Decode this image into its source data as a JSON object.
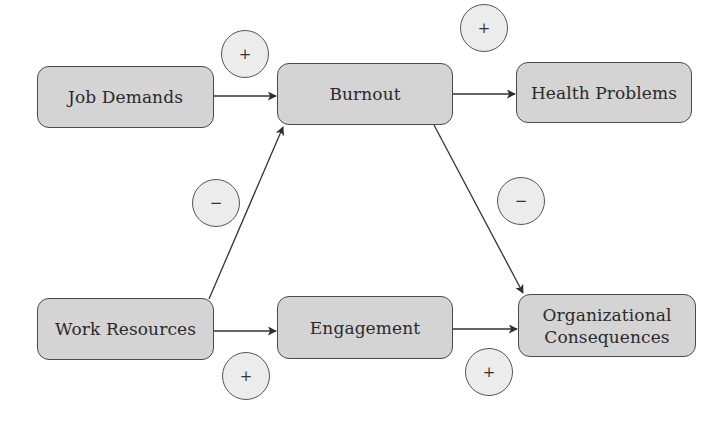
{
  "diagram": {
    "type": "flow",
    "nodes": [
      {
        "id": "job_demands",
        "label": "Job Demands"
      },
      {
        "id": "burnout",
        "label": "Burnout"
      },
      {
        "id": "health_problems",
        "label": "Health Problems"
      },
      {
        "id": "work_resources",
        "label": "Work Resources"
      },
      {
        "id": "engagement",
        "label": "Engagement"
      },
      {
        "id": "org_consequences",
        "label_line1": "Organizational",
        "label_line2": "Consequences"
      }
    ],
    "edges": [
      {
        "from": "Job Demands",
        "to": "Burnout",
        "sign": "+"
      },
      {
        "from": "Burnout",
        "to": "Health Problems",
        "sign": "+"
      },
      {
        "from": "Work Resources",
        "to": "Burnout",
        "sign": "−"
      },
      {
        "from": "Burnout",
        "to": "Organizational Consequences",
        "sign": "−"
      },
      {
        "from": "Work Resources",
        "to": "Engagement",
        "sign": "+"
      },
      {
        "from": "Engagement",
        "to": "Organizational Consequences",
        "sign": "+"
      }
    ],
    "colors": {
      "node_fill": "#d4d4d4",
      "node_border": "#4a4a4a",
      "sign_fill": "#ececec",
      "line": "#333333"
    }
  }
}
